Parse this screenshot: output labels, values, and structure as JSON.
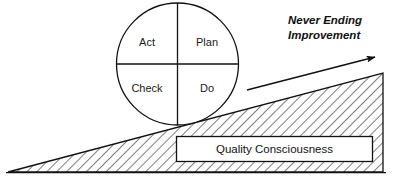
{
  "diagram": {
    "colors": {
      "stroke": "#111111",
      "fill_white": "#ffffff",
      "hatch": "#111111",
      "text": "#111111"
    },
    "cycle": {
      "name": "pdca-cycle",
      "quadrants": [
        {
          "id": "act",
          "label": "Act",
          "position": "top-left"
        },
        {
          "id": "plan",
          "label": "Plan",
          "position": "top-right"
        },
        {
          "id": "check",
          "label": "Check",
          "position": "bottom-left"
        },
        {
          "id": "do",
          "label": "Do",
          "position": "bottom-right"
        }
      ]
    },
    "arrow": {
      "name": "never-ending-improvement-arrow",
      "caption_line_1": "Never Ending",
      "caption_line_2": "Improvement"
    },
    "slope": {
      "name": "quality-consciousness-slope",
      "box_label": "Quality Consciousness"
    }
  }
}
